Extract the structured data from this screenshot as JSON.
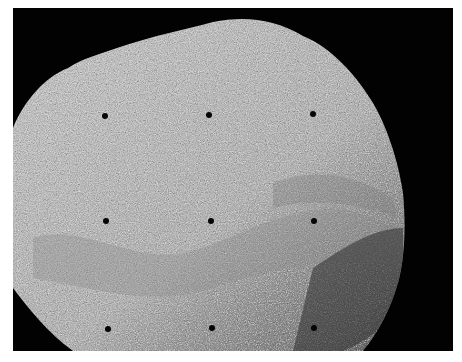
{
  "image": {
    "description": "Grayscale photograph of a rough, granular rock surface against a black background with a 3x3 grid of small black dot markers",
    "background_color": "#020202",
    "surface_color": "#b9b9b9",
    "margin_color": "#ffffff"
  },
  "markers": [
    {
      "row": 1,
      "col": 1,
      "x": 105,
      "y": 116
    },
    {
      "row": 1,
      "col": 2,
      "x": 209,
      "y": 115
    },
    {
      "row": 1,
      "col": 3,
      "x": 313,
      "y": 114
    },
    {
      "row": 2,
      "col": 1,
      "x": 106,
      "y": 221
    },
    {
      "row": 2,
      "col": 2,
      "x": 211,
      "y": 221
    },
    {
      "row": 2,
      "col": 3,
      "x": 314,
      "y": 221
    },
    {
      "row": 3,
      "col": 1,
      "x": 108,
      "y": 329
    },
    {
      "row": 3,
      "col": 2,
      "x": 212,
      "y": 328
    },
    {
      "row": 3,
      "col": 3,
      "x": 314,
      "y": 328
    }
  ]
}
